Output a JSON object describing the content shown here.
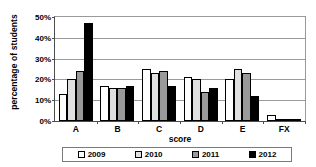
{
  "chart_data": {
    "type": "bar",
    "title": "",
    "xlabel": "score",
    "ylabel": "percentage of students",
    "categories": [
      "A",
      "B",
      "C",
      "D",
      "E",
      "FX"
    ],
    "ylim": [
      0,
      50
    ],
    "ytick_labels": [
      "0%",
      "10%",
      "20%",
      "30%",
      "40%",
      "50%"
    ],
    "ytick_values": [
      0,
      10,
      20,
      30,
      40,
      50
    ],
    "grid": true,
    "legend_position": "bottom",
    "series": [
      {
        "name": "2009",
        "color": "#ffffff",
        "values": [
          13,
          17,
          25,
          21,
          20,
          3
        ]
      },
      {
        "name": "2010",
        "color": "#e0e0e0",
        "values": [
          20,
          16,
          23,
          20,
          25,
          1
        ]
      },
      {
        "name": "2011",
        "color": "#9a9a9a",
        "values": [
          24,
          16,
          24,
          14,
          23,
          1
        ]
      },
      {
        "name": "2012",
        "color": "#000000",
        "values": [
          47,
          17,
          17,
          16,
          12,
          1
        ]
      }
    ]
  },
  "axis": {
    "y_title": "percentage of students",
    "x_title": "score"
  }
}
